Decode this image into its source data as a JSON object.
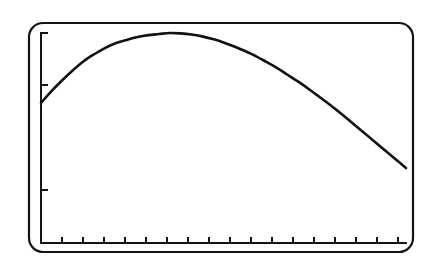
{
  "figure": {
    "kind": "scanned-line-plot",
    "caption": "",
    "background_color": "#ffffff",
    "ink_color": "#111111"
  },
  "bezel": {
    "name": "rounded display frame",
    "stroke_color": "#141414",
    "stroke_width": 2.2,
    "corner_radius": 14,
    "x": 29,
    "y": 23,
    "width": 384,
    "height": 229
  },
  "axes": {
    "stroke_color": "#141414",
    "stroke_width": 2.0,
    "x_axis": {
      "y": 243,
      "x_start": 41,
      "x_end": 406
    },
    "y_axis": {
      "x": 41,
      "y_start": 33,
      "y_end": 243
    },
    "x_tick_length": 6,
    "y_tick_length": 7,
    "x_tick_positions": [
      62,
      83,
      104,
      125,
      146,
      167,
      188,
      209,
      230,
      251,
      272,
      293,
      314,
      335,
      356,
      377,
      398
    ],
    "y_tick_positions": [
      33,
      85,
      190
    ],
    "grid": "off",
    "xlabel": "",
    "ylabel": "",
    "x_tick_labels": [],
    "y_tick_labels": []
  },
  "chart_data": {
    "type": "line",
    "title": "",
    "subtitle": "",
    "xlabel": "",
    "ylabel": "",
    "grid": false,
    "legend": null,
    "legend_position": "none",
    "annotations": [],
    "xlim": [
      0,
      17
    ],
    "ylim": [
      0,
      1
    ],
    "x_tick_labels": [],
    "y_tick_labels": [],
    "series": [
      {
        "name": "curve",
        "color": "#111111",
        "line_width": 2.6,
        "x": [
          0.0,
          0.5,
          1.0,
          1.5,
          2.0,
          2.5,
          3.0,
          3.5,
          4.0,
          4.5,
          5.0,
          5.5,
          6.0,
          6.5,
          7.0,
          7.5,
          8.0,
          8.5,
          9.0,
          9.5,
          10.0,
          10.5,
          11.0,
          11.5,
          12.0,
          12.5,
          13.0,
          13.5,
          14.0,
          14.5,
          15.0,
          15.5,
          16.0,
          16.5,
          17.0
        ],
        "y": [
          0.667,
          0.724,
          0.776,
          0.824,
          0.867,
          0.9,
          0.929,
          0.952,
          0.967,
          0.981,
          0.99,
          0.995,
          1.0,
          0.998,
          0.993,
          0.984,
          0.971,
          0.955,
          0.936,
          0.914,
          0.89,
          0.862,
          0.833,
          0.8,
          0.767,
          0.731,
          0.693,
          0.655,
          0.614,
          0.571,
          0.529,
          0.486,
          0.443,
          0.4,
          0.357
        ]
      }
    ],
    "features": {
      "start_point": {
        "x": 0.0,
        "y": 0.667
      },
      "peak_point": {
        "x": 6.0,
        "y": 1.0
      },
      "end_point": {
        "x": 17.0,
        "y": 0.357
      },
      "shape": "rises steeply then flattens to a broad maximum near the left third, then falls with increasing slope toward the right edge"
    }
  }
}
